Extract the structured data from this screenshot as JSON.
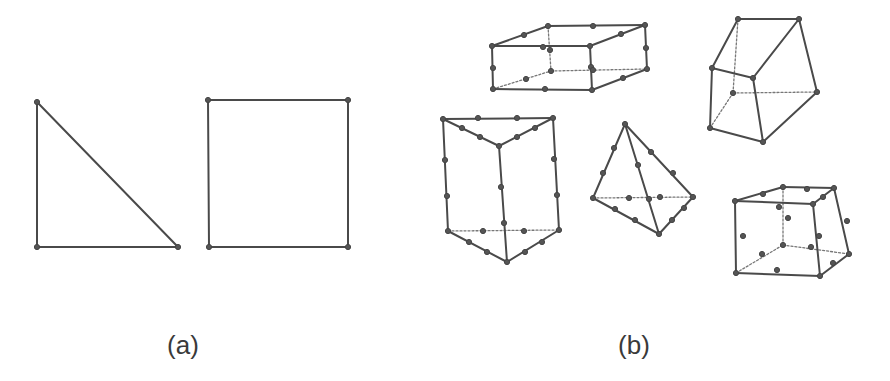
{
  "figure": {
    "labels": [
      {
        "id": "a",
        "text": "(a)",
        "x": 183,
        "y": 330
      },
      {
        "id": "b",
        "text": "(b)",
        "x": 634,
        "y": 330
      }
    ],
    "colors": {
      "edge": "#4a4a4a",
      "hidden_edge": "#777777",
      "node": "#555555",
      "background": "#ffffff"
    },
    "panel_a": {
      "title": "2D elements",
      "elements": [
        {
          "name": "triangle-element",
          "nodes": [
            [
              37,
              102
            ],
            [
              37,
              247
            ],
            [
              178,
              247
            ]
          ],
          "edges": [
            [
              [
                37,
                102
              ],
              [
                37,
                247
              ]
            ],
            [
              [
                37,
                247
              ],
              [
                178,
                247
              ]
            ],
            [
              [
                178,
                247
              ],
              [
                37,
                102
              ]
            ]
          ],
          "hidden": []
        },
        {
          "name": "quadrilateral-element",
          "nodes": [
            [
              208,
              100
            ],
            [
              348,
              100
            ],
            [
              348,
              247
            ],
            [
              209,
              247
            ]
          ],
          "edges": [
            [
              [
                208,
                100
              ],
              [
                348,
                100
              ]
            ],
            [
              [
                348,
                100
              ],
              [
                348,
                247
              ]
            ],
            [
              [
                348,
                247
              ],
              [
                209,
                247
              ]
            ],
            [
              [
                209,
                247
              ],
              [
                208,
                100
              ]
            ]
          ],
          "hidden": []
        }
      ]
    },
    "panel_b": {
      "title": "3D elements",
      "elements": [
        {
          "name": "hexahedron-20-node-element",
          "nodes": [
            [
              492,
              46
            ],
            [
              590,
              46
            ],
            [
              548,
              26
            ],
            [
              645,
              25
            ],
            [
              493,
              89
            ],
            [
              592,
              90
            ],
            [
              647,
              69
            ],
            [
              551,
              71
            ],
            [
              543,
              47
            ],
            [
              524,
              35
            ],
            [
              593,
              26
            ],
            [
              621,
              34
            ],
            [
              493,
              68
            ],
            [
              591,
              67
            ],
            [
              646,
              48
            ],
            [
              545,
              89
            ],
            [
              623,
              78
            ],
            [
              526,
              79
            ],
            [
              593,
              70
            ],
            [
              550,
              50
            ]
          ],
          "edges": [
            [
              [
                492,
                46
              ],
              [
                590,
                46
              ]
            ],
            [
              [
                492,
                46
              ],
              [
                548,
                26
              ]
            ],
            [
              [
                548,
                26
              ],
              [
                645,
                25
              ]
            ],
            [
              [
                590,
                46
              ],
              [
                645,
                25
              ]
            ],
            [
              [
                492,
                46
              ],
              [
                493,
                89
              ]
            ],
            [
              [
                590,
                46
              ],
              [
                592,
                90
              ]
            ],
            [
              [
                645,
                25
              ],
              [
                647,
                69
              ]
            ],
            [
              [
                493,
                89
              ],
              [
                592,
                90
              ]
            ],
            [
              [
                592,
                90
              ],
              [
                647,
                69
              ]
            ]
          ],
          "hidden": [
            [
              [
                548,
                26
              ],
              [
                551,
                71
              ]
            ],
            [
              [
                493,
                89
              ],
              [
                551,
                71
              ]
            ],
            [
              [
                551,
                71
              ],
              [
                647,
                69
              ]
            ]
          ]
        },
        {
          "name": "hexahedron-8-node-element",
          "nodes": [
            [
              738,
              19
            ],
            [
              799,
              19
            ],
            [
              712,
              68
            ],
            [
              753,
              78
            ],
            [
              733,
              93
            ],
            [
              817,
              92
            ],
            [
              710,
              128
            ],
            [
              763,
              142
            ]
          ],
          "edges": [
            [
              [
                738,
                19
              ],
              [
                799,
                19
              ]
            ],
            [
              [
                738,
                19
              ],
              [
                712,
                68
              ]
            ],
            [
              [
                799,
                19
              ],
              [
                753,
                78
              ]
            ],
            [
              [
                712,
                68
              ],
              [
                753,
                78
              ]
            ],
            [
              [
                799,
                19
              ],
              [
                817,
                92
              ]
            ],
            [
              [
                712,
                68
              ],
              [
                710,
                128
              ]
            ],
            [
              [
                753,
                78
              ],
              [
                763,
                142
              ]
            ],
            [
              [
                710,
                128
              ],
              [
                763,
                142
              ]
            ],
            [
              [
                763,
                142
              ],
              [
                817,
                92
              ]
            ]
          ],
          "hidden": [
            [
              [
                738,
                19
              ],
              [
                733,
                93
              ]
            ],
            [
              [
                733,
                93
              ],
              [
                817,
                92
              ]
            ],
            [
              [
                733,
                93
              ],
              [
                710,
                128
              ]
            ]
          ]
        },
        {
          "name": "wedge-15-node-element",
          "nodes": [
            [
              443,
              119
            ],
            [
              553,
              118
            ],
            [
              499,
              146
            ],
            [
              448,
              231
            ],
            [
              559,
              230
            ],
            [
              507,
              262
            ],
            [
              478,
              118
            ],
            [
              517,
              118
            ],
            [
              462,
              128
            ],
            [
              480,
              137
            ],
            [
              517,
              137
            ],
            [
              535,
              128
            ],
            [
              445,
              160
            ],
            [
              447,
              196
            ],
            [
              554,
              159
            ],
            [
              557,
              195
            ],
            [
              501,
              187
            ],
            [
              504,
              223
            ],
            [
              483,
              231
            ],
            [
              524,
              231
            ],
            [
              469,
              242
            ],
            [
              487,
              252
            ],
            [
              525,
              252
            ],
            [
              542,
              242
            ]
          ],
          "edges": [
            [
              [
                443,
                119
              ],
              [
                553,
                118
              ]
            ],
            [
              [
                443,
                119
              ],
              [
                499,
                146
              ]
            ],
            [
              [
                553,
                118
              ],
              [
                499,
                146
              ]
            ],
            [
              [
                443,
                119
              ],
              [
                448,
                231
              ]
            ],
            [
              [
                553,
                118
              ],
              [
                559,
                230
              ]
            ],
            [
              [
                499,
                146
              ],
              [
                507,
                262
              ]
            ],
            [
              [
                448,
                231
              ],
              [
                507,
                262
              ]
            ],
            [
              [
                507,
                262
              ],
              [
                559,
                230
              ]
            ]
          ],
          "hidden": [
            [
              [
                448,
                231
              ],
              [
                559,
                230
              ]
            ]
          ]
        },
        {
          "name": "tetrahedron-10-node-element",
          "nodes": [
            [
              625,
              124
            ],
            [
              593,
              198
            ],
            [
              693,
              197
            ],
            [
              659,
              234
            ],
            [
              614,
              148
            ],
            [
              603,
              173
            ],
            [
              651,
              152
            ],
            [
              673,
              173
            ],
            [
              638,
              165
            ],
            [
              649,
              199
            ],
            [
              629,
              198
            ],
            [
              660,
              197
            ],
            [
              615,
              209
            ],
            [
              635,
              220
            ],
            [
              672,
              220
            ],
            [
              684,
              208
            ]
          ],
          "edges": [
            [
              [
                625,
                124
              ],
              [
                593,
                198
              ]
            ],
            [
              [
                625,
                124
              ],
              [
                693,
                197
              ]
            ],
            [
              [
                625,
                124
              ],
              [
                659,
                234
              ]
            ],
            [
              [
                593,
                198
              ],
              [
                659,
                234
              ]
            ],
            [
              [
                659,
                234
              ],
              [
                693,
                197
              ]
            ]
          ],
          "hidden": [
            [
              [
                593,
                198
              ],
              [
                693,
                197
              ]
            ]
          ]
        },
        {
          "name": "curved-hexahedron-20-node-element",
          "nodes": [
            [
              735,
              201
            ],
            [
              813,
              204
            ],
            [
              783,
              187
            ],
            [
              834,
              188
            ],
            [
              736,
              273
            ],
            [
              820,
              276
            ],
            [
              783,
              245
            ],
            [
              849,
              254
            ],
            [
              779,
              207
            ],
            [
              763,
              194
            ],
            [
              807,
              189
            ],
            [
              823,
              197
            ],
            [
              743,
              236
            ],
            [
              819,
              236
            ],
            [
              847,
              221
            ],
            [
              788,
              218
            ],
            [
              777,
              270
            ],
            [
              762,
              254
            ],
            [
              811,
              247
            ],
            [
              833,
              263
            ]
          ],
          "edges": [
            [
              [
                735,
                201
              ],
              [
                813,
                204
              ]
            ],
            [
              [
                735,
                201
              ],
              [
                783,
                187
              ]
            ],
            [
              [
                783,
                187
              ],
              [
                834,
                188
              ]
            ],
            [
              [
                813,
                204
              ],
              [
                834,
                188
              ]
            ],
            [
              [
                735,
                201
              ],
              [
                736,
                273
              ]
            ],
            [
              [
                813,
                204
              ],
              [
                820,
                276
              ]
            ],
            [
              [
                834,
                188
              ],
              [
                849,
                254
              ]
            ],
            [
              [
                736,
                273
              ],
              [
                820,
                276
              ]
            ],
            [
              [
                820,
                276
              ],
              [
                849,
                254
              ]
            ]
          ],
          "hidden": [
            [
              [
                783,
                187
              ],
              [
                783,
                245
              ]
            ],
            [
              [
                736,
                273
              ],
              [
                783,
                245
              ]
            ],
            [
              [
                783,
                245
              ],
              [
                849,
                254
              ]
            ]
          ]
        }
      ]
    }
  }
}
